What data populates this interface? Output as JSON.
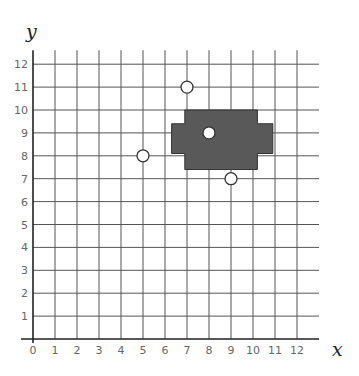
{
  "chart_data": {
    "type": "scatter",
    "title": "",
    "xlabel": "x",
    "ylabel": "y",
    "xlim": [
      0,
      12
    ],
    "ylim": [
      0,
      12
    ],
    "x_ticks": [
      0,
      1,
      2,
      3,
      4,
      5,
      6,
      7,
      8,
      9,
      10,
      11,
      12
    ],
    "y_ticks": [
      1,
      2,
      3,
      4,
      5,
      6,
      7,
      8,
      9,
      10,
      11,
      12
    ],
    "grid": true,
    "points": [
      {
        "x": 7,
        "y": 11
      },
      {
        "x": 5,
        "y": 8
      },
      {
        "x": 8,
        "y": 9
      },
      {
        "x": 9,
        "y": 7
      }
    ],
    "shaded_region": {
      "color": "#595959",
      "vertices": [
        [
          6.9,
          10.0
        ],
        [
          10.2,
          10.0
        ],
        [
          10.2,
          9.4
        ],
        [
          10.9,
          9.4
        ],
        [
          10.9,
          8.1
        ],
        [
          10.2,
          8.1
        ],
        [
          10.2,
          7.4
        ],
        [
          6.9,
          7.4
        ],
        [
          6.9,
          8.1
        ],
        [
          6.3,
          8.1
        ],
        [
          6.3,
          9.4
        ],
        [
          6.9,
          9.4
        ]
      ]
    },
    "colors": {
      "grid": "#555555",
      "axis": "#222222",
      "point_fill": "#ffffff",
      "point_stroke": "#333333"
    }
  }
}
